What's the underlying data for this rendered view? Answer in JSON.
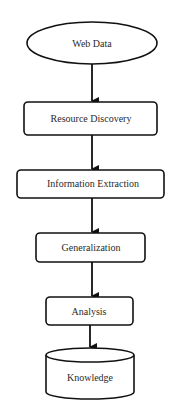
{
  "diagram": {
    "type": "flowchart",
    "direction": "top-to-bottom",
    "nodes": [
      {
        "id": "web-data",
        "label": "Web Data",
        "shape": "ellipse"
      },
      {
        "id": "resource-discovery",
        "label": "Resource Discovery",
        "shape": "rounded-rect"
      },
      {
        "id": "information-extraction",
        "label": "Information Extraction",
        "shape": "rounded-rect"
      },
      {
        "id": "generalization",
        "label": "Generalization",
        "shape": "rounded-rect"
      },
      {
        "id": "analysis",
        "label": "Analysis",
        "shape": "rounded-rect"
      },
      {
        "id": "knowledge",
        "label": "Knowledge",
        "shape": "cylinder"
      }
    ],
    "edges": [
      {
        "from": "web-data",
        "to": "resource-discovery"
      },
      {
        "from": "resource-discovery",
        "to": "information-extraction"
      },
      {
        "from": "information-extraction",
        "to": "generalization"
      },
      {
        "from": "generalization",
        "to": "analysis"
      },
      {
        "from": "analysis",
        "to": "knowledge"
      }
    ],
    "colors": {
      "stroke": "#111111",
      "text": "#2a2a2a",
      "background": "#ffffff"
    }
  }
}
